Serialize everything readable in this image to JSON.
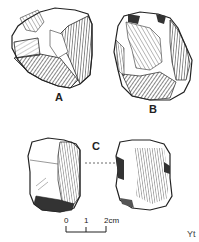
{
  "figure": {
    "specimens": [
      {
        "id": "A",
        "label": "A"
      },
      {
        "id": "B",
        "label": "B"
      },
      {
        "id": "C",
        "label": "C",
        "views": 2
      }
    ],
    "scale_bar": {
      "ticks": [
        "0",
        "1",
        "2cm"
      ]
    },
    "edge_text": "Yt"
  }
}
